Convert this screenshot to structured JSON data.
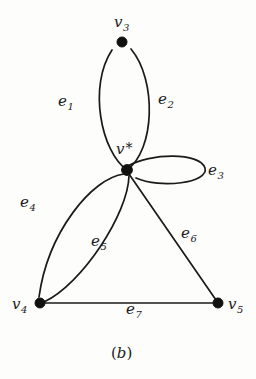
{
  "figure": {
    "caption": "(b)",
    "caption_open": "(",
    "caption_letter": "b",
    "caption_close": ")",
    "background_color": "#fdfdfc",
    "ink_color": "#1a1a1a"
  },
  "vertices": [
    {
      "id": "v3",
      "base": "v",
      "sub": "3",
      "label": "v3",
      "x": 122,
      "y": 42,
      "label_x": 114,
      "label_y": 14
    },
    {
      "id": "vstar",
      "base": "v",
      "sub": "",
      "label": "v*",
      "x": 127,
      "y": 170,
      "label_x": 116,
      "label_y": 141
    },
    {
      "id": "v4",
      "base": "v",
      "sub": "4",
      "label": "v4",
      "x": 40,
      "y": 303,
      "label_x": 12,
      "label_y": 296
    },
    {
      "id": "v5",
      "base": "v",
      "sub": "5",
      "label": "v5",
      "x": 218,
      "y": 303,
      "label_x": 228,
      "label_y": 296
    }
  ],
  "edges": [
    {
      "id": "e1",
      "base": "e",
      "sub": "1",
      "label": "e1",
      "from": "vstar",
      "to": "v3",
      "kind": "curve-left",
      "label_x": 58,
      "label_y": 93
    },
    {
      "id": "e2",
      "base": "e",
      "sub": "2",
      "label": "e2",
      "from": "vstar",
      "to": "v3",
      "kind": "curve-right",
      "label_x": 158,
      "label_y": 91
    },
    {
      "id": "e3",
      "base": "e",
      "sub": "3",
      "label": "e3",
      "from": "vstar",
      "to": "vstar",
      "kind": "self-loop",
      "label_x": 208,
      "label_y": 162
    },
    {
      "id": "e4",
      "base": "e",
      "sub": "4",
      "label": "e4",
      "from": "vstar",
      "to": "v4",
      "kind": "curve-left",
      "label_x": 20,
      "label_y": 194
    },
    {
      "id": "e5",
      "base": "e",
      "sub": "5",
      "label": "e5",
      "from": "vstar",
      "to": "v4",
      "kind": "curve-right",
      "label_x": 91,
      "label_y": 233
    },
    {
      "id": "e6",
      "base": "e",
      "sub": "6",
      "label": "e6",
      "from": "vstar",
      "to": "v5",
      "kind": "straight",
      "label_x": 181,
      "label_y": 225
    },
    {
      "id": "e7",
      "base": "e",
      "sub": "7",
      "label": "e7",
      "from": "v4",
      "to": "v5",
      "kind": "straight",
      "label_x": 126,
      "label_y": 301
    }
  ],
  "geometry": {
    "e1_path": "M 127 170 C 101 152, 88 86, 112 50",
    "e2_path": "M 127 170 C 155 150, 157 80, 131 49",
    "e3_path": "M 128 166 C 150 153, 200 152, 205 168 C 209 183, 160 189, 136 178",
    "e4_path": "M 124 174 C 92 178, 48 232, 39 297",
    "e5_path": "M 129 176 C 128 214, 82 284, 44 302",
    "e6_path": "M 129 174 L 216 300",
    "e7_path": "M 42 303 L 215 303"
  }
}
